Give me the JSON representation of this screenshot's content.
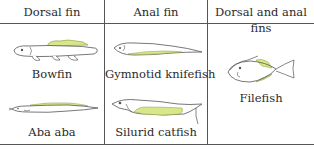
{
  "table": {
    "headers": [
      "Dorsal fin",
      "Anal fin",
      "Dorsal and anal fins"
    ],
    "columns": [
      {
        "header": "Dorsal fin",
        "fish": [
          "Bowfin",
          "Aba aba"
        ]
      },
      {
        "header": "Anal fin",
        "fish": [
          "Gymnotid knifefish",
          "Silurid catfish"
        ]
      },
      {
        "header": "Dorsal and anal fins",
        "fish": [
          "Filefish"
        ]
      }
    ]
  },
  "colors": {
    "fin_highlight": "#d6e88a",
    "outline": "#555555",
    "rule": "#555555"
  }
}
